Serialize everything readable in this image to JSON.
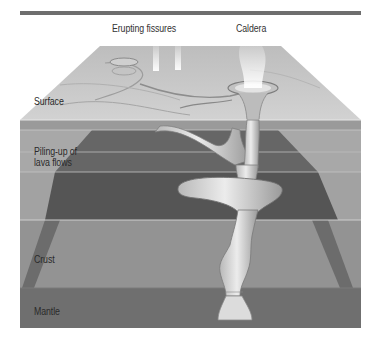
{
  "figure": {
    "title_rule": true,
    "top_labels": [
      {
        "id": "erupting-fissures",
        "text": "Erupting fissures"
      },
      {
        "id": "caldera",
        "text": "Caldera"
      }
    ],
    "layer_labels": [
      {
        "id": "surface",
        "text": "Surface"
      },
      {
        "id": "lava-flows",
        "line1": "Piling-up of",
        "line2": "lava flows"
      },
      {
        "id": "crust",
        "text": "Crust"
      },
      {
        "id": "mantle",
        "text": "Mantle"
      }
    ],
    "colors": {
      "rule": "#6e6e6e",
      "surface": "#c9c9c9",
      "band_light": "#a6a6a6",
      "band_dark": "#5e5e5e",
      "crust": "#8f8f8f",
      "mantle": "#6a6a6a",
      "conduit": "#d8d8d8"
    }
  }
}
